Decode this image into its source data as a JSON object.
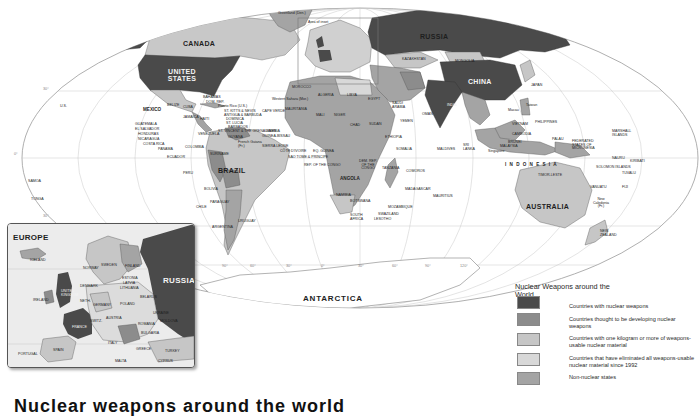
{
  "map": {
    "title": "Nuclear Weapons around the World",
    "inset_marker_label": "Area of inset",
    "ocean_color": "#ffffff",
    "land_default_color": "#dcdcdc",
    "labels": {
      "canada": "CANADA",
      "united_states": "UNITED STATES",
      "greenland": "Greenland (Den.)",
      "us_hawaii": "U.S.",
      "mexico": "MEXICO",
      "guatemala": "GUATEMALA",
      "el_salvador": "EL SALVADOR",
      "honduras": "HONDURAS",
      "nicaragua": "NICARAGUA",
      "costa_rica": "COSTA RICA",
      "panama": "PANAMA",
      "belize": "BELIZE",
      "cuba": "CUBA",
      "jamaica": "JAMAICA",
      "haiti": "HAITI",
      "bahamas": "BAHAMAS",
      "dom_rep": "DOM. REP.",
      "puerto_rico": "Puerto Rico (U.S.)",
      "st_kitts": "ST. KITTS & NEVIS",
      "antigua": "ANTIGUA & BARBUDA",
      "dominica": "DOMINICA",
      "st_lucia": "ST. LUCIA",
      "barbados": "BARBADOS",
      "st_vincent": "ST. VINCENT & THE GRENADINES",
      "grenada": "GRENADA",
      "trinidad": "TRINIDAD & TOBAGO",
      "venezuela": "VENEZUELA",
      "guyana": "GUYANA",
      "suriname": "SURINAME",
      "french_guiana": "French Guiana (Fr.)",
      "colombia": "COLOMBIA",
      "ecuador": "ECUADOR",
      "peru": "PERU",
      "brazil": "BRAZIL",
      "bolivia": "BOLIVIA",
      "paraguay": "PARAGUAY",
      "chile": "CHILE",
      "argentina": "ARGENTINA",
      "uruguay": "URUGUAY",
      "samoa": "SAMOA",
      "tonga": "TONGA",
      "morocco": "MOROCCO",
      "western_sahara": "Western Sahara (Mor.)",
      "algeria": "ALGERIA",
      "libya": "LIBYA",
      "egypt": "EGYPT",
      "mauritania": "MAURITANIA",
      "mali": "MALI",
      "niger": "NIGER",
      "chad": "CHAD",
      "sudan": "SUDAN",
      "cape_verde": "CAPE VERDE",
      "senegal": "SENEGAL",
      "gambia": "GAMBIA",
      "guinea_bissau": "GUINEA-BISSAU",
      "guinea": "GUINEA",
      "sierra_leone": "SIERRA LEONE",
      "liberia": "LIBERIA",
      "cote_divoire": "CÔTE D'IVOIRE",
      "eq_guinea": "EQ. GUINEA",
      "sao_tome": "SAO TOME & PRINCIPE",
      "rep_congo": "REP. OF THE CONGO",
      "ghana": "GHANA",
      "nigeria": "NIGERIA",
      "cameroon": "CAMEROON",
      "car": "CENTRAL AFRICAN REP.",
      "ethiopia": "ETHIOPIA",
      "somalia": "SOMALIA",
      "kenya": "KENYA",
      "drc": "DEM. REP. OF THE CONGO",
      "tanzania": "TANZANIA",
      "angola": "ANGOLA",
      "zambia": "ZAMBIA",
      "malawi": "MALAWI",
      "namibia": "NAMIBIA",
      "botswana": "BOTSWANA",
      "zimbabwe": "ZIMBABWE",
      "mozambique": "MOZAMBIQUE",
      "madagascar": "MADAGASCAR",
      "comoros": "COMOROS",
      "seychelles": "SEYCHELLES",
      "mauritius": "MAURITIUS",
      "south_africa": "SOUTH AFRICA",
      "swaziland": "SWAZILAND",
      "lesotho": "LESOTHO",
      "russia": "RUSSIA",
      "kazakhstan": "KAZAKHSTAN",
      "mongolia": "MONGOLIA",
      "china": "CHINA",
      "georgia": "GEORGIA",
      "uzbekistan": "UZBEKISTAN",
      "turkmenistan": "TURKMENISTAN",
      "afghanistan": "AFGHANISTAN",
      "pakistan": "PAKISTAN",
      "iran": "IRAN",
      "iraq": "IRAQ",
      "syria": "SYRIA",
      "saudi_arabia": "SAUDI ARABIA",
      "yemen": "YEMEN",
      "oman": "OMAN",
      "kuwait": "KUWAIT",
      "india": "INDIA",
      "nepal": "NEPAL",
      "bhutan": "BHUTAN",
      "bangladesh": "BANGLADESH",
      "sri_lanka": "SRI LANKA",
      "maldives": "MALDIVES",
      "myanmar": "MYANMAR",
      "north_korea": "N. KOREA",
      "south_korea": "S. KOREA",
      "japan": "JAPAN",
      "taiwan": "Taiwan",
      "macau": "Macau",
      "hong_kong": "Hong Kong",
      "vietnam": "VIETNAM",
      "cambodia": "CAMBODIA",
      "philippines": "PHILIPPINES",
      "brunei": "BRUNEI",
      "malaysia": "MALAYSIA",
      "singapore": "Singapore",
      "indonesia": "I N D O N E S I A",
      "east_timor": "TIMOR-LESTE",
      "palau": "PALAU",
      "micronesia": "FEDERATED STATES OF MICRONESIA",
      "marshall": "MARSHALL ISLANDS",
      "nauru": "NAURU",
      "kiribati": "KIRIBATI",
      "tuvalu": "TUVALU",
      "png": "PAPUA NEW GUINEA",
      "solomon": "SOLOMON ISLANDS",
      "vanuatu": "VANUATU",
      "fiji": "FIJI",
      "new_caledonia": "New Caledonia (Fr.)",
      "australia": "AUSTRALIA",
      "new_zealand": "NEW ZEALAND",
      "antarctica": "ANTARCTICA"
    },
    "graticule": {
      "lat_30n": "30°",
      "lat_0": "0°",
      "lat_30s": "30°",
      "lon_labels": [
        "150°",
        "120°",
        "90°",
        "60°",
        "30°",
        "0°",
        "30°",
        "60°",
        "90°",
        "120°",
        "150°"
      ]
    }
  },
  "inset": {
    "title": "EUROPE",
    "labels": {
      "russia": "RUSSIA",
      "iceland": "ICELAND",
      "norway": "NORWAY",
      "sweden": "SWEDEN",
      "finland": "FINLAND",
      "denmark": "DENMARK",
      "ireland": "IRELAND",
      "united_kingdom": "UNITED KINGDOM",
      "netherlands": "NETH.",
      "germany": "GERMANY",
      "poland": "POLAND",
      "belarus": "BELARUS",
      "estonia": "ESTONIA",
      "latvia": "LATVIA",
      "lithuania": "LITHUANIA",
      "ukraine": "UKRAINE",
      "moldova": "MOLDOVA",
      "romania": "ROMANIA",
      "bulgaria": "BULGARIA",
      "france": "FRANCE",
      "switzerland": "SWITZ.",
      "austria": "AUSTRIA",
      "italy": "ITALY",
      "spain": "SPAIN",
      "portugal": "PORTUGAL",
      "greece": "GREECE",
      "turkey": "TURKEY",
      "malta": "MALTA",
      "cyprus": "CYPRUS"
    }
  },
  "legend": {
    "title": "Nuclear Weapons around the World",
    "items": [
      {
        "label": "Countries with nuclear weapons",
        "color": "#4a4a4a"
      },
      {
        "label": "Countries thought to be developing nuclear weapons",
        "color": "#8c8c8c"
      },
      {
        "label": "Countries with one kilogram or more of weapons-usable nuclear material",
        "color": "#c6c6c6"
      },
      {
        "label": "Countries that have eliminated all weapons-usable nuclear material since 1992",
        "color": "#d8d8d8"
      },
      {
        "label": "Non-nuclear states",
        "color": "#a4a4a4"
      }
    ]
  },
  "caption": {
    "partial_text": "Nuclear weapons around the world"
  }
}
